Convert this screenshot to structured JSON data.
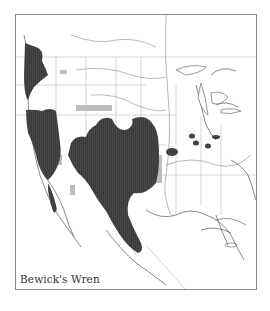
{
  "map": {
    "title": "Bewick's Wren",
    "colors": {
      "range": "#3a3a3a",
      "range_hatch": "#4a4a4a",
      "secondary_range": "#bdbdbd",
      "coast": "#6a6a6a",
      "border": "#b5b5b5",
      "river": "#9a9a9a",
      "frame": "#8a8a8a",
      "background": "#ffffff"
    },
    "legend": {
      "dark_fill": "year-round range",
      "light_fill": "secondary range"
    }
  }
}
